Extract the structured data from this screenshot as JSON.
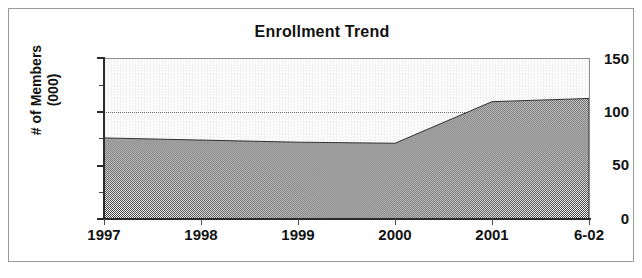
{
  "chart_data": {
    "type": "area",
    "title": "Enrollment Trend",
    "xlabel": "",
    "ylabel_line1": "# of Members",
    "ylabel_line2": "(000)",
    "categories": [
      "1997",
      "1998",
      "1999",
      "2000",
      "2001",
      "6-02"
    ],
    "values": [
      76,
      74,
      72,
      71,
      110,
      113
    ],
    "series": [
      {
        "name": "# of Members (000)",
        "values": [
          76,
          74,
          72,
          71,
          110,
          113
        ],
        "fill_color": "#4d4d4d"
      }
    ],
    "ylim": [
      0,
      150
    ],
    "y_ticks": [
      0,
      50,
      100,
      150
    ],
    "y_minor_ticks": [
      25,
      75,
      125
    ],
    "y_tick_labels": [
      "0",
      "50",
      "100",
      "150"
    ],
    "gridlines": [
      100
    ],
    "grid": true,
    "legend": "none",
    "plot_background": "#f0f0f0",
    "frame_color": "#9a9a9a",
    "axis_color": "#2b2b2b"
  },
  "chart": {
    "title": "Enrollment Trend",
    "y_axis": {
      "title_line1": "# of Members",
      "title_line2": "(000)",
      "labels": [
        "150",
        "100",
        "50",
        "0"
      ]
    },
    "x_axis": {
      "labels": [
        "1997",
        "1998",
        "1999",
        "2000",
        "2001",
        "6-02"
      ]
    }
  }
}
